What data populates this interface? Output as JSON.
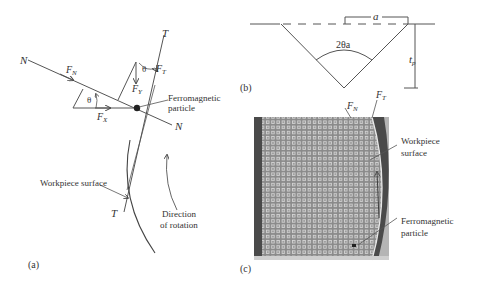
{
  "panels": {
    "a": {
      "label": "(a)",
      "axes": {
        "normal": "N",
        "normal_end": "N",
        "tangent": "T",
        "tangent_end": "T"
      },
      "forces": {
        "fn": {
          "sym": "F",
          "sub": "N"
        },
        "ft": {
          "sym": "F",
          "sub": "T"
        },
        "fx": {
          "sym": "F",
          "sub": "X"
        },
        "fy": {
          "sym": "F",
          "sub": "Y"
        }
      },
      "angle_1": "θ",
      "angle_2": "θ",
      "particle_label_1": "Ferromagnetic",
      "particle_label_2": "particle",
      "surface_label": "Workpiece surface",
      "rotation_label_1": "Direction",
      "rotation_label_2": "of rotation"
    },
    "b": {
      "label": "(b)",
      "width_sym": "a",
      "angle_sym": "2θa",
      "depth_sym": "t",
      "depth_sub": "p"
    },
    "c": {
      "label": "(c)",
      "fn": {
        "sym": "F",
        "sub": "N"
      },
      "ft": {
        "sym": "F",
        "sub": "T"
      },
      "surface_label_1": "Workpiece",
      "surface_label_2": "surface",
      "particle_label_1": "Ferromagnetic",
      "particle_label_2": "particle",
      "colors": {
        "mesh_bg": "#8a8a8a",
        "mesh_dot": "#d8d8d8",
        "dark_band": "#4a4a4a",
        "edge_band": "#b5b5b5"
      }
    }
  }
}
